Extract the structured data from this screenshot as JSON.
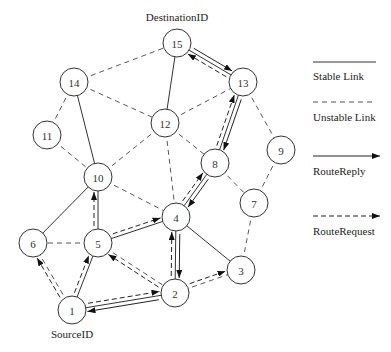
{
  "labels": {
    "destination": "DestinationID",
    "source": "SourceID"
  },
  "legend": {
    "stable": "Stable Link",
    "unstable": "Unstable Link",
    "reply": "RouteReply",
    "request": "RouteRequest"
  },
  "nodes": [
    {
      "id": "1",
      "x": 72,
      "y": 310
    },
    {
      "id": "2",
      "x": 175,
      "y": 293
    },
    {
      "id": "3",
      "x": 241,
      "y": 270
    },
    {
      "id": "4",
      "x": 176,
      "y": 217
    },
    {
      "id": "5",
      "x": 98,
      "y": 243
    },
    {
      "id": "6",
      "x": 33,
      "y": 243
    },
    {
      "id": "7",
      "x": 254,
      "y": 203
    },
    {
      "id": "8",
      "x": 215,
      "y": 163
    },
    {
      "id": "9",
      "x": 281,
      "y": 150
    },
    {
      "id": "10",
      "x": 98,
      "y": 177
    },
    {
      "id": "11",
      "x": 47,
      "y": 135
    },
    {
      "id": "12",
      "x": 165,
      "y": 123
    },
    {
      "id": "13",
      "x": 243,
      "y": 82
    },
    {
      "id": "14",
      "x": 74,
      "y": 82
    },
    {
      "id": "15",
      "x": 177,
      "y": 43
    }
  ],
  "stable_links": [
    [
      "1",
      "5"
    ],
    [
      "1",
      "2"
    ],
    [
      "5",
      "4"
    ],
    [
      "5",
      "10"
    ],
    [
      "10",
      "6"
    ],
    [
      "10",
      "14"
    ],
    [
      "4",
      "2"
    ],
    [
      "4",
      "3"
    ],
    [
      "4",
      "8"
    ],
    [
      "8",
      "13"
    ],
    [
      "13",
      "15"
    ],
    [
      "15",
      "12"
    ]
  ],
  "unstable_links": [
    [
      "14",
      "15"
    ],
    [
      "14",
      "11"
    ],
    [
      "14",
      "12"
    ],
    [
      "11",
      "10"
    ],
    [
      "10",
      "12"
    ],
    [
      "10",
      "4"
    ],
    [
      "12",
      "4"
    ],
    [
      "12",
      "8"
    ],
    [
      "12",
      "13"
    ],
    [
      "13",
      "9"
    ],
    [
      "9",
      "7"
    ],
    [
      "8",
      "7"
    ],
    [
      "7",
      "3"
    ],
    [
      "2",
      "3"
    ],
    [
      "5",
      "6"
    ],
    [
      "5",
      "2"
    ],
    [
      "1",
      "6"
    ]
  ],
  "route_request": [
    [
      "1",
      "6"
    ],
    [
      "1",
      "5"
    ],
    [
      "1",
      "2"
    ],
    [
      "5",
      "10"
    ],
    [
      "5",
      "4"
    ],
    [
      "2",
      "5"
    ],
    [
      "2",
      "4"
    ],
    [
      "2",
      "3"
    ],
    [
      "4",
      "8"
    ],
    [
      "8",
      "13"
    ],
    [
      "13",
      "15"
    ]
  ],
  "route_reply": [
    [
      "15",
      "13"
    ],
    [
      "13",
      "8"
    ],
    [
      "8",
      "4"
    ],
    [
      "4",
      "2"
    ],
    [
      "2",
      "1"
    ]
  ]
}
